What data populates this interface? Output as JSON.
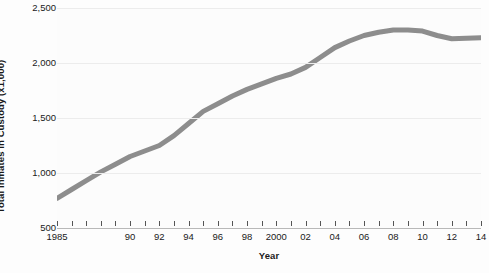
{
  "chart_data": {
    "type": "line",
    "title": "",
    "xlabel": "Year",
    "ylabel": "Total Inmates in Custody (x1,000)",
    "xlim": [
      1985,
      2014
    ],
    "ylim": [
      500,
      2500
    ],
    "grid": true,
    "legend": "none",
    "line_color": "#8d8d8d",
    "line_width": 5,
    "y_ticks": [
      {
        "value": 2500,
        "label": "2,500"
      },
      {
        "value": 2000,
        "label": "2,000"
      },
      {
        "value": 1500,
        "label": "1,500"
      },
      {
        "value": 1000,
        "label": "1,000"
      },
      {
        "value": 500,
        "label": "500"
      }
    ],
    "x_tick_labels": [
      {
        "value": 1985,
        "label": "1985"
      },
      {
        "value": 1990,
        "label": "90"
      },
      {
        "value": 1992,
        "label": "92"
      },
      {
        "value": 1994,
        "label": "94"
      },
      {
        "value": 1996,
        "label": "96"
      },
      {
        "value": 1998,
        "label": "98"
      },
      {
        "value": 2000,
        "label": "2000"
      },
      {
        "value": 2002,
        "label": "02"
      },
      {
        "value": 2004,
        "label": "04"
      },
      {
        "value": 2006,
        "label": "06"
      },
      {
        "value": 2008,
        "label": "08"
      },
      {
        "value": 2010,
        "label": "10"
      },
      {
        "value": 2012,
        "label": "12"
      },
      {
        "value": 2014,
        "label": "14"
      }
    ],
    "x_tick_marks": [
      1985,
      1986,
      1987,
      1988,
      1989,
      1990,
      1991,
      1992,
      1993,
      1994,
      1995,
      1996,
      1997,
      1998,
      1999,
      2000,
      2001,
      2002,
      2003,
      2004,
      2005,
      2006,
      2007,
      2008,
      2009,
      2010,
      2011,
      2012,
      2013,
      2014
    ],
    "x": [
      1985,
      1986,
      1987,
      1988,
      1989,
      1990,
      1991,
      1992,
      1993,
      1994,
      1995,
      1996,
      1997,
      1998,
      1999,
      2000,
      2001,
      2002,
      2003,
      2004,
      2005,
      2006,
      2007,
      2008,
      2009,
      2010,
      2011,
      2012,
      2013,
      2014
    ],
    "values": [
      770,
      850,
      930,
      1010,
      1080,
      1150,
      1200,
      1250,
      1340,
      1450,
      1560,
      1630,
      1700,
      1760,
      1810,
      1860,
      1900,
      1960,
      2050,
      2140,
      2200,
      2250,
      2280,
      2300,
      2300,
      2290,
      2250,
      2220,
      2225,
      2230
    ],
    "series": [
      {
        "name": "Total inmates in custody",
        "values": [
          770,
          850,
          930,
          1010,
          1080,
          1150,
          1200,
          1250,
          1340,
          1450,
          1560,
          1630,
          1700,
          1760,
          1810,
          1860,
          1900,
          1960,
          2050,
          2140,
          2200,
          2250,
          2280,
          2300,
          2300,
          2290,
          2250,
          2220,
          2225,
          2230
        ]
      }
    ]
  }
}
